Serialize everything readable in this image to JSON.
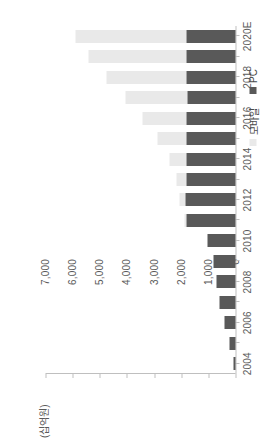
{
  "chart_data": {
    "type": "bar",
    "subtype": "stacked-horizontal-bar",
    "orientation": "horizontal",
    "title": "",
    "xlabel": "",
    "ylabel": "(십억원)",
    "unit_label": "(십억원)",
    "categories": [
      "2004",
      "2005",
      "2006",
      "2007",
      "2008",
      "2009",
      "2010",
      "2011",
      "2012",
      "2013",
      "2014",
      "2015",
      "2016",
      "2017",
      "2018",
      "2019",
      "2020E"
    ],
    "category_tick_labels": [
      "2004",
      "2006",
      "2008",
      "2010",
      "2012",
      "2014",
      "2016",
      "2018",
      "2020E"
    ],
    "value_tick_labels": [
      "0",
      "1,000",
      "2,000",
      "3,000",
      "4,000",
      "5,000",
      "6,000",
      "7,000"
    ],
    "value_ticks": [
      0,
      1000,
      2000,
      3000,
      4000,
      5000,
      6000,
      7000
    ],
    "ylim": [
      0,
      7000
    ],
    "grid": false,
    "legend_position": "bottom-left-of-rotated-view",
    "series": [
      {
        "name": "PC",
        "color": "#595959",
        "values": [
          90,
          230,
          390,
          580,
          700,
          820,
          1050,
          1800,
          1850,
          1800,
          1820,
          1790,
          1800,
          1780,
          1790,
          1800,
          1790
        ]
      },
      {
        "name": "모바일",
        "color": "#e9e9e9",
        "values": [
          0,
          0,
          0,
          0,
          0,
          0,
          0,
          70,
          200,
          360,
          620,
          1080,
          1630,
          2260,
          2980,
          3600,
          4120
        ]
      }
    ],
    "totals": [
      90,
      230,
      390,
      580,
      700,
      820,
      1050,
      1870,
      2050,
      2160,
      2440,
      2870,
      3430,
      4040,
      4770,
      5400,
      5910
    ]
  },
  "legend": {
    "items": [
      {
        "label": "모바일",
        "color": "#e9e9e9"
      },
      {
        "label": "PC",
        "color": "#595959"
      }
    ]
  },
  "colors": {
    "pc": "#595959",
    "mobile": "#e9e9e9",
    "axis": "#bfbfbf",
    "text": "#5a5a5a",
    "background": "#ffffff"
  }
}
